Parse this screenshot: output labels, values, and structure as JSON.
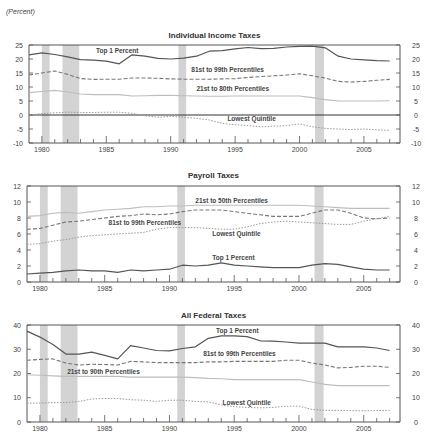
{
  "unit_label": "(Percent)",
  "recessions": [
    [
      1980.0,
      1980.6
    ],
    [
      1981.6,
      1982.9
    ],
    [
      1990.6,
      1991.2
    ],
    [
      2001.2,
      2001.9
    ]
  ],
  "colors": {
    "recession": "#d3d3d3",
    "top1": "#555555",
    "p81_99": "#777777",
    "p21_80": "#bdbdbd",
    "lowest": "#9a9a9a",
    "frame": "#555555"
  },
  "chart_data": [
    {
      "type": "line",
      "title": "Individual Income Taxes",
      "xlabel": "",
      "ylabel": "Percent",
      "ylim": [
        -10,
        25
      ],
      "yticks": [
        -10,
        -5,
        0,
        5,
        10,
        15,
        20,
        25
      ],
      "xticks": [
        1980,
        1985,
        1990,
        1995,
        2000,
        2005
      ],
      "x": [
        1979,
        1980,
        1981,
        1982,
        1983,
        1984,
        1985,
        1986,
        1987,
        1988,
        1989,
        1990,
        1991,
        1992,
        1993,
        1994,
        1995,
        1996,
        1997,
        1998,
        1999,
        2000,
        2001,
        2002,
        2003,
        2004,
        2005,
        2006,
        2007
      ],
      "series": [
        {
          "name": "Top 1 Percent",
          "style": "solid-dark",
          "values": [
            21.5,
            22.2,
            21.6,
            20.8,
            19.8,
            19.6,
            19.2,
            18.3,
            21.5,
            21.0,
            20.2,
            20.0,
            20.3,
            21.0,
            22.8,
            23.0,
            23.6,
            24.1,
            23.7,
            23.8,
            24.3,
            24.5,
            24.6,
            24.0,
            21.0,
            20.0,
            19.7,
            19.4,
            19.3
          ]
        },
        {
          "name": "81st to 99th Percentiles",
          "style": "dashed",
          "values": [
            14.3,
            15.0,
            15.7,
            14.5,
            13.0,
            12.7,
            12.8,
            12.8,
            13.2,
            13.2,
            13.1,
            12.9,
            12.8,
            12.8,
            12.8,
            12.9,
            13.0,
            13.4,
            13.7,
            14.0,
            14.3,
            14.7,
            14.0,
            13.2,
            12.0,
            11.8,
            12.0,
            12.4,
            12.7
          ]
        },
        {
          "name": "21st to 80th Percentiles",
          "style": "solid-light",
          "values": [
            8.0,
            8.4,
            8.8,
            8.2,
            7.5,
            7.3,
            7.3,
            7.3,
            6.8,
            6.9,
            7.0,
            7.0,
            6.9,
            6.8,
            6.7,
            6.7,
            6.8,
            6.8,
            6.8,
            6.8,
            6.8,
            6.8,
            6.2,
            5.5,
            5.0,
            5.0,
            5.0,
            5.0,
            5.1
          ]
        },
        {
          "name": "Lowest Quintile",
          "style": "dotted",
          "values": [
            0.0,
            0.5,
            0.8,
            1.0,
            0.9,
            0.9,
            1.0,
            1.0,
            0.6,
            -0.3,
            -0.8,
            -0.5,
            -0.8,
            -1.2,
            -1.8,
            -3.0,
            -3.5,
            -3.8,
            -4.2,
            -4.0,
            -3.8,
            -3.2,
            -4.2,
            -4.8,
            -5.0,
            -5.2,
            -5.0,
            -5.3,
            -5.5
          ]
        }
      ],
      "annotations": [
        {
          "text": "Top 1 Percent",
          "x": 1984.2,
          "y": 22.0
        },
        {
          "text": "81st to 99th Percentiles",
          "x": 1991.6,
          "y": 15.2
        },
        {
          "text": "21st to 80th Percentiles",
          "x": 1992.0,
          "y": 8.4
        },
        {
          "text": "Lowest Quintile",
          "x": 1994.4,
          "y": -2.0
        }
      ]
    },
    {
      "type": "line",
      "title": "Payroll Taxes",
      "xlabel": "",
      "ylabel": "Percent",
      "ylim": [
        0,
        12
      ],
      "yticks": [
        0,
        2,
        4,
        6,
        8,
        10,
        12
      ],
      "xticks": [
        1980,
        1985,
        1990,
        1995,
        2000,
        2005
      ],
      "x": [
        1979,
        1980,
        1981,
        1982,
        1983,
        1984,
        1985,
        1986,
        1987,
        1988,
        1989,
        1990,
        1991,
        1992,
        1993,
        1994,
        1995,
        1996,
        1997,
        1998,
        1999,
        2000,
        2001,
        2002,
        2003,
        2004,
        2005,
        2006,
        2007
      ],
      "series": [
        {
          "name": "21st to 50th Percentiles",
          "style": "solid-light",
          "values": [
            8.2,
            8.3,
            8.6,
            8.7,
            8.6,
            8.8,
            9.0,
            9.1,
            9.2,
            9.4,
            9.4,
            9.5,
            9.5,
            9.6,
            9.6,
            9.6,
            9.6,
            9.6,
            9.6,
            9.6,
            9.6,
            9.6,
            9.5,
            9.4,
            9.3,
            9.2,
            9.2,
            9.2,
            9.2
          ]
        },
        {
          "name": "81st to 99th Percentiles",
          "style": "dashed",
          "values": [
            6.6,
            6.7,
            7.1,
            7.5,
            7.6,
            7.8,
            8.0,
            8.2,
            8.3,
            8.5,
            8.4,
            8.5,
            8.8,
            9.0,
            9.0,
            9.0,
            8.8,
            8.6,
            8.4,
            8.2,
            8.2,
            8.2,
            8.6,
            9.0,
            9.0,
            8.6,
            8.0,
            7.9,
            8.0
          ]
        },
        {
          "name": "Lowest Quintile",
          "style": "dotted",
          "values": [
            4.7,
            4.8,
            5.1,
            5.3,
            5.6,
            5.8,
            5.9,
            6.0,
            6.1,
            6.2,
            6.6,
            6.8,
            6.8,
            6.8,
            6.7,
            6.6,
            6.6,
            6.9,
            7.3,
            7.5,
            7.6,
            7.5,
            7.4,
            7.3,
            7.2,
            7.2,
            7.6,
            7.9,
            8.2
          ]
        },
        {
          "name": "Top 1 Percent",
          "style": "solid-dark",
          "values": [
            1.0,
            1.1,
            1.2,
            1.4,
            1.5,
            1.4,
            1.4,
            1.2,
            1.5,
            1.4,
            1.5,
            1.6,
            2.1,
            2.0,
            2.1,
            2.4,
            2.1,
            2.0,
            1.9,
            1.8,
            1.8,
            1.8,
            2.1,
            2.3,
            2.2,
            1.9,
            1.6,
            1.5,
            1.5
          ]
        }
      ],
      "annotations": [
        {
          "text": "21st to 50th Percentiles",
          "x": 1992.0,
          "y": 9.9
        },
        {
          "text": "81st to 99th Percentiles",
          "x": 1985.3,
          "y": 7.1
        },
        {
          "text": "Lowest Quintile",
          "x": 1993.3,
          "y": 5.8
        },
        {
          "text": "Top 1 Percent",
          "x": 1993.3,
          "y": 2.8
        }
      ]
    },
    {
      "type": "line",
      "title": "All Federal Taxes",
      "xlabel": "",
      "ylabel": "Percent",
      "ylim": [
        0,
        40
      ],
      "yticks": [
        0,
        10,
        20,
        30,
        40
      ],
      "xticks": [
        1980,
        1985,
        1990,
        1995,
        2000,
        2005
      ],
      "x": [
        1979,
        1980,
        1981,
        1982,
        1983,
        1984,
        1985,
        1986,
        1987,
        1988,
        1989,
        1990,
        1991,
        1992,
        1993,
        1994,
        1995,
        1996,
        1997,
        1998,
        1999,
        2000,
        2001,
        2002,
        2003,
        2004,
        2005,
        2006,
        2007
      ],
      "series": [
        {
          "name": "Top 1 Percent",
          "style": "solid-dark",
          "values": [
            37.5,
            35.0,
            32.0,
            28.0,
            28.0,
            28.8,
            27.5,
            26.0,
            31.5,
            30.5,
            29.5,
            29.3,
            30.3,
            31.0,
            34.5,
            35.5,
            35.5,
            35.2,
            33.5,
            33.3,
            33.0,
            32.5,
            32.5,
            32.5,
            31.0,
            31.0,
            31.0,
            30.5,
            29.5
          ]
        },
        {
          "name": "81st to 99th Percentiles",
          "style": "dashed",
          "values": [
            25.5,
            25.8,
            26.0,
            24.3,
            23.5,
            23.8,
            23.7,
            23.5,
            25.0,
            24.8,
            24.5,
            24.5,
            24.5,
            24.5,
            24.8,
            24.8,
            25.0,
            25.0,
            25.0,
            25.0,
            25.5,
            25.5,
            24.3,
            23.5,
            22.3,
            22.5,
            23.0,
            23.0,
            22.5
          ]
        },
        {
          "name": "21st to 80th Percentiles",
          "style": "solid-light",
          "values": [
            19.5,
            19.3,
            19.0,
            18.8,
            18.8,
            18.8,
            18.8,
            18.8,
            18.5,
            18.5,
            18.5,
            18.5,
            18.5,
            18.3,
            18.0,
            17.8,
            17.5,
            17.5,
            17.5,
            17.5,
            17.5,
            17.5,
            16.5,
            15.5,
            15.0,
            15.0,
            15.0,
            15.0,
            15.0
          ]
        },
        {
          "name": "Lowest Quintile",
          "style": "dotted",
          "values": [
            7.8,
            7.8,
            8.0,
            8.0,
            8.5,
            9.5,
            9.7,
            9.7,
            9.2,
            9.0,
            8.5,
            9.0,
            9.0,
            8.5,
            8.3,
            7.0,
            6.3,
            6.0,
            5.8,
            6.0,
            6.5,
            6.5,
            5.2,
            4.8,
            4.8,
            4.7,
            4.6,
            4.7,
            4.8
          ]
        }
      ],
      "annotations": [
        {
          "text": "Top 1 Percent",
          "x": 1993.6,
          "y": 36.8
        },
        {
          "text": "81st to 99th Percentiles",
          "x": 1992.6,
          "y": 27.2
        },
        {
          "text": "21st to 90th Percentiles",
          "x": 1982.1,
          "y": 19.8
        },
        {
          "text": "Lowest Quintile",
          "x": 1994.1,
          "y": 7.2
        }
      ]
    }
  ]
}
